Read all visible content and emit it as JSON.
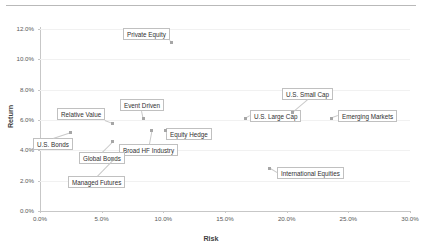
{
  "chart_data": {
    "type": "scatter",
    "title": "",
    "xlabel": "Risk",
    "ylabel": "Return",
    "xlim": [
      0,
      30
    ],
    "ylim": [
      0,
      12
    ],
    "xtick_labels": [
      "0.0%",
      "5.0%",
      "10.0%",
      "15.0%",
      "20.0%",
      "25.0%",
      "30.0%"
    ],
    "ytick_labels": [
      "0.0%",
      "2.0%",
      "4.0%",
      "6.0%",
      "8.0%",
      "10.0%",
      "12.0%"
    ],
    "xticks": [
      0,
      5,
      10,
      15,
      20,
      25,
      30
    ],
    "yticks": [
      0,
      2,
      4,
      6,
      8,
      10,
      12
    ],
    "grid": "horizontal",
    "legend": "none",
    "units": "percent",
    "points": [
      {
        "label": "Private Equity",
        "x": 10.7,
        "y": 11.1
      },
      {
        "label": "U.S. Small Cap",
        "x": 20.5,
        "y": 6.5
      },
      {
        "label": "Emerging Markets",
        "x": 23.6,
        "y": 6.1
      },
      {
        "label": "U.S. Large Cap",
        "x": 16.7,
        "y": 6.1
      },
      {
        "label": "Event Driven",
        "x": 8.4,
        "y": 6.1
      },
      {
        "label": "Relative Value",
        "x": 5.9,
        "y": 5.8
      },
      {
        "label": "Equity Hedge",
        "x": 10.2,
        "y": 5.3
      },
      {
        "label": "Broad HF Industry",
        "x": 9.0,
        "y": 5.3
      },
      {
        "label": "U.S. Bonds",
        "x": 2.5,
        "y": 5.2
      },
      {
        "label": "Global Bonds",
        "x": 5.9,
        "y": 4.6
      },
      {
        "label": "Managed Futures",
        "x": 5.9,
        "y": 3.4
      },
      {
        "label": "International Equities",
        "x": 18.6,
        "y": 2.8
      }
    ],
    "labels": [
      {
        "text": "Private Equity",
        "px": 123,
        "py": 28
      },
      {
        "text": "U.S. Small Cap",
        "px": 282,
        "py": 88
      },
      {
        "text": "Emerging Markets",
        "px": 338,
        "py": 110
      },
      {
        "text": "U.S. Large Cap",
        "px": 250,
        "py": 110
      },
      {
        "text": "Event Driven",
        "px": 120,
        "py": 99
      },
      {
        "text": "Relative Value",
        "px": 57,
        "py": 108
      },
      {
        "text": "Equity Hedge",
        "px": 166,
        "py": 128
      },
      {
        "text": "Broad HF Industry",
        "px": 119,
        "py": 144
      },
      {
        "text": "U.S. Bonds",
        "px": 33,
        "py": 138
      },
      {
        "text": "Global Bonds",
        "px": 79,
        "py": 152
      },
      {
        "text": "Managed Futures",
        "px": 68,
        "py": 176
      },
      {
        "text": "International Equities",
        "px": 277,
        "py": 167
      }
    ]
  }
}
